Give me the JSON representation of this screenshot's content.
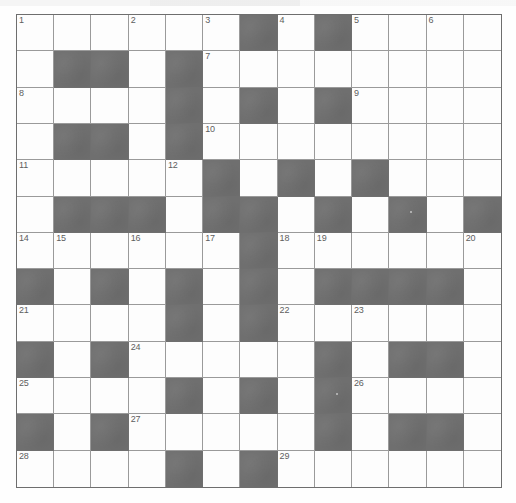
{
  "puzzle": {
    "title": "Crossword Grid",
    "type": "crossword",
    "rows": 13,
    "cols": 13,
    "colors": {
      "block": "#6f6f6f",
      "cell": "#fdfdfd",
      "grid_line": "#9a9a9a",
      "border": "#6e6e6e",
      "number_text": "#5d5d5d",
      "page": "#fefefe"
    },
    "legend": {
      "black_symbol": "#",
      "white_symbol": "."
    },
    "grid": [
      "......#.#....",
      ".##.#........",
      "....#.#.#....",
      ".##.#........",
      ".....#.#.#...",
      ".###.##.#.#.#",
      "......#......",
      "#.#.#.#.####.",
      "....#.#......",
      "#.#.....#.##.",
      "....#.#.#....",
      "#.#.....#.##.",
      "....#.#......"
    ],
    "numbers": [
      {
        "n": 1,
        "row": 1,
        "col": 1
      },
      {
        "n": 2,
        "row": 1,
        "col": 4
      },
      {
        "n": 3,
        "row": 1,
        "col": 6
      },
      {
        "n": 4,
        "row": 1,
        "col": 8
      },
      {
        "n": 5,
        "row": 1,
        "col": 10
      },
      {
        "n": 6,
        "row": 1,
        "col": 12
      },
      {
        "n": 7,
        "row": 2,
        "col": 6
      },
      {
        "n": 8,
        "row": 3,
        "col": 1
      },
      {
        "n": 9,
        "row": 3,
        "col": 10
      },
      {
        "n": 10,
        "row": 4,
        "col": 6
      },
      {
        "n": 11,
        "row": 5,
        "col": 1
      },
      {
        "n": 12,
        "row": 5,
        "col": 5
      },
      {
        "n": 13,
        "row": 5,
        "col": 10
      },
      {
        "n": 14,
        "row": 7,
        "col": 1
      },
      {
        "n": 15,
        "row": 7,
        "col": 2
      },
      {
        "n": 16,
        "row": 7,
        "col": 4
      },
      {
        "n": 17,
        "row": 7,
        "col": 6
      },
      {
        "n": 18,
        "row": 7,
        "col": 8
      },
      {
        "n": 19,
        "row": 7,
        "col": 9
      },
      {
        "n": 20,
        "row": 7,
        "col": 13
      },
      {
        "n": 21,
        "row": 9,
        "col": 1
      },
      {
        "n": 22,
        "row": 9,
        "col": 8
      },
      {
        "n": 23,
        "row": 9,
        "col": 10
      },
      {
        "n": 24,
        "row": 10,
        "col": 4
      },
      {
        "n": 25,
        "row": 11,
        "col": 1
      },
      {
        "n": 26,
        "row": 11,
        "col": 10
      },
      {
        "n": 27,
        "row": 12,
        "col": 4
      },
      {
        "n": 28,
        "row": 13,
        "col": 1
      },
      {
        "n": 29,
        "row": 13,
        "col": 8
      }
    ],
    "specks": [
      {
        "row": 6,
        "col": 11
      },
      {
        "row": 11,
        "col": 9
      }
    ]
  }
}
